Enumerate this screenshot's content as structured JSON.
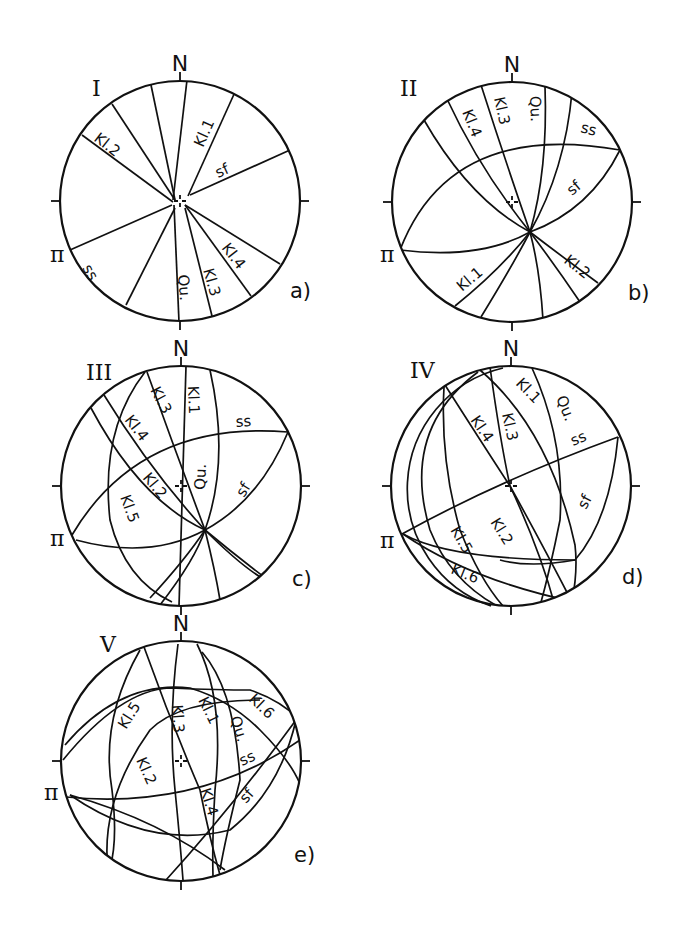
{
  "figure": {
    "background": "#ffffff",
    "ink": "#111111",
    "radius": 120,
    "diagrams": [
      {
        "id": "a",
        "numeral": "I",
        "sublabel": "a)",
        "north": "N",
        "pi": "π",
        "cx": 180,
        "cy": 201,
        "numeral_pos": [
          92,
          96
        ],
        "sublabel_pos": [
          290,
          298
        ],
        "pi_pos": [
          50,
          262
        ],
        "planes": [
          {
            "name": "Kl.1",
            "d": "M 235 92 L 188 196"
          },
          {
            "name": "unlabeled-1",
            "d": "M 187 80 L 173 200"
          },
          {
            "name": "unlabeled-2",
            "d": "M 151 85 L 175 200"
          },
          {
            "name": "unlabeled-3",
            "d": "M 112 104 L 175 200"
          },
          {
            "name": "Kl.2",
            "d": "M 82 135 L 173 202"
          },
          {
            "name": "sf",
            "d": "M 290 150 L 190 195"
          },
          {
            "name": "ss",
            "d": "M 70 250 L 172 205"
          },
          {
            "name": "unlabeled-4",
            "d": "M 126 305 L 175 208"
          },
          {
            "name": "Qu.",
            "d": "M 179 322 L 174 205"
          },
          {
            "name": "Kl.3",
            "d": "M 212 316 L 185 208"
          },
          {
            "name": "Kl.4",
            "d": "M 251 296 L 185 205"
          },
          {
            "name": "unlabeled-5",
            "d": "M 280 264 L 185 205"
          }
        ],
        "labels": [
          {
            "text": "Kl.1",
            "x": 203,
            "y": 148,
            "rot": -66
          },
          {
            "text": "Kl.2",
            "x": 93,
            "y": 140,
            "rot": 38
          },
          {
            "text": "sf",
            "x": 218,
            "y": 178,
            "rot": -24
          },
          {
            "text": "ss",
            "x": 82,
            "y": 268,
            "rot": 60
          },
          {
            "text": "Qu.",
            "x": 178,
            "y": 275,
            "rot": 85
          },
          {
            "text": "Kl.3",
            "x": 203,
            "y": 270,
            "rot": 74
          },
          {
            "text": "Kl.4",
            "x": 221,
            "y": 248,
            "rot": 52
          }
        ]
      },
      {
        "id": "b",
        "numeral": "II",
        "sublabel": "b)",
        "north": "N",
        "pi": "π",
        "cx": 512,
        "cy": 202,
        "numeral_pos": [
          400,
          96
        ],
        "sublabel_pos": [
          628,
          300
        ],
        "pi_pos": [
          380,
          262
        ],
        "planes": [
          {
            "name": "Kl.4",
            "d": "M 447 99 Q 480 170 530 232"
          },
          {
            "name": "Kl.3",
            "d": "M 481 85 Q 505 160 530 232"
          },
          {
            "name": "Qu.",
            "d": "M 545 86 Q 548 170 530 232"
          },
          {
            "name": "unlabeled-1",
            "d": "M 572 92 Q 565 170 530 232"
          },
          {
            "name": "unlabeled-2",
            "d": "M 424 120 Q 470 200 530 232"
          },
          {
            "name": "ss",
            "d": "M 400 250 Q 450 120 620 150"
          },
          {
            "name": "sf",
            "d": "M 620 150 Q 590 210 530 232"
          },
          {
            "name": "pi-girdle",
            "d": "M 400 250 Q 480 260 530 232"
          },
          {
            "name": "Kl.1",
            "d": "M 455 306 Q 500 270 530 232"
          },
          {
            "name": "unlabeled-3",
            "d": "M 481 317 Q 510 270 530 232"
          },
          {
            "name": "unlabeled-4",
            "d": "M 543 320 Q 540 270 530 232"
          },
          {
            "name": "unlabeled-5",
            "d": "M 580 302 Q 555 265 530 232"
          },
          {
            "name": "Kl.2",
            "d": "M 598 283 Q 560 255 530 232"
          }
        ],
        "labels": [
          {
            "text": "Kl.4",
            "x": 462,
            "y": 112,
            "rot": 68
          },
          {
            "text": "Kl.3",
            "x": 494,
            "y": 98,
            "rot": 78
          },
          {
            "text": "Qu.",
            "x": 530,
            "y": 96,
            "rot": 88
          },
          {
            "text": "ss",
            "x": 580,
            "y": 132,
            "rot": 14
          },
          {
            "text": "sf",
            "x": 572,
            "y": 196,
            "rot": -40
          },
          {
            "text": "Kl.1",
            "x": 462,
            "y": 292,
            "rot": -40
          },
          {
            "text": "Kl.2",
            "x": 563,
            "y": 262,
            "rot": 38
          }
        ]
      },
      {
        "id": "c",
        "numeral": "III",
        "sublabel": "c)",
        "north": "N",
        "pi": "π",
        "cx": 181,
        "cy": 486,
        "numeral_pos": [
          86,
          380
        ],
        "sublabel_pos": [
          292,
          586
        ],
        "pi_pos": [
          50,
          546
        ],
        "planes": [
          {
            "name": "Kl.1",
            "d": "M 186 366 L 179 606"
          },
          {
            "name": "Qu.",
            "d": "M 210 370 Q 230 460 205 530 Q 195 560 160 605"
          },
          {
            "name": "Kl.3",
            "d": "M 147 372 Q 175 450 205 530 Q 215 570 220 600"
          },
          {
            "name": "Kl.4",
            "d": "M 104 395 Q 150 470 205 530 Q 240 565 262 578"
          },
          {
            "name": "unlabeled-1",
            "d": "M 91 408 Q 140 500 205 530 Q 235 555 268 580"
          },
          {
            "name": "Kl.5",
            "d": "M 145 372 Q 100 430 110 520 Q 125 580 172 602"
          },
          {
            "name": "Kl.2",
            "d": "M 76 540 Q 150 560 205 530"
          },
          {
            "name": "ss",
            "d": "M 72 535 Q 140 420 288 432"
          },
          {
            "name": "sf",
            "d": "M 288 432 Q 260 500 205 530"
          },
          {
            "name": "unlabeled-2",
            "d": "M 150 598 Q 185 560 205 530"
          }
        ],
        "labels": [
          {
            "text": "Kl.1",
            "x": 188,
            "y": 386,
            "rot": 88
          },
          {
            "text": "Kl.3",
            "x": 150,
            "y": 390,
            "rot": 62
          },
          {
            "text": "Kl.4",
            "x": 124,
            "y": 420,
            "rot": 52
          },
          {
            "text": "ss",
            "x": 236,
            "y": 427,
            "rot": -4
          },
          {
            "text": "Qu.",
            "x": 205,
            "y": 490,
            "rot": -88
          },
          {
            "text": "sf",
            "x": 244,
            "y": 498,
            "rot": -58
          },
          {
            "text": "Kl.2",
            "x": 142,
            "y": 478,
            "rot": 50
          },
          {
            "text": "Kl.5",
            "x": 120,
            "y": 497,
            "rot": 70
          }
        ]
      },
      {
        "id": "d",
        "numeral": "IV",
        "sublabel": "d)",
        "north": "N",
        "pi": "π",
        "cx": 511,
        "cy": 486,
        "numeral_pos": [
          410,
          378
        ],
        "sublabel_pos": [
          622,
          584
        ],
        "pi_pos": [
          380,
          548
        ],
        "planes": [
          {
            "name": "Kl.1",
            "d": "M 480 370 Q 550 430 575 545 Q 578 570 572 602"
          },
          {
            "name": "Qu.",
            "d": "M 532 368 Q 565 440 560 520 Q 550 570 540 606"
          },
          {
            "name": "Kl.3",
            "d": "M 490 367 Q 500 440 510 486"
          },
          {
            "name": "Kl.4",
            "d": "M 445 385 Q 480 440 510 486 Q 540 540 572 602"
          },
          {
            "name": "Kl.2",
            "d": "M 510 486 Q 540 550 555 606"
          },
          {
            "name": "outer-arc",
            "d": "M 478 372 Q 400 430 430 530 Q 450 580 497 606"
          },
          {
            "name": "Kl.5-arc",
            "d": "M 444 387 Q 440 460 460 530 Q 480 580 503 606"
          },
          {
            "name": "ss",
            "d": "M 402 534 Q 500 480 618 437"
          },
          {
            "name": "sf",
            "d": "M 618 437 Q 610 520 575 560 Q 530 568 500 560"
          },
          {
            "name": "Kl.5",
            "d": "M 403 534 Q 450 560 575 560"
          },
          {
            "name": "Kl.6",
            "d": "M 403 534 Q 470 580 575 602"
          }
        ],
        "labels": [
          {
            "text": "Kl.1",
            "x": 515,
            "y": 384,
            "rot": 46
          },
          {
            "text": "Qu.",
            "x": 556,
            "y": 398,
            "rot": 68
          },
          {
            "text": "Kl.3",
            "x": 502,
            "y": 414,
            "rot": 78
          },
          {
            "text": "Kl.4",
            "x": 470,
            "y": 420,
            "rot": 56
          },
          {
            "text": "ss",
            "x": 573,
            "y": 446,
            "rot": -22
          },
          {
            "text": "sf",
            "x": 586,
            "y": 510,
            "rot": -62
          },
          {
            "text": "Kl.2",
            "x": 490,
            "y": 522,
            "rot": 58
          },
          {
            "text": "Kl.5",
            "x": 450,
            "y": 530,
            "rot": 60
          },
          {
            "text": "Kl.6",
            "x": 450,
            "y": 573,
            "rot": 22
          }
        ]
      },
      {
        "id": "e",
        "numeral": "V",
        "sublabel": "e)",
        "north": "N",
        "pi": "π",
        "cx": 181,
        "cy": 761,
        "numeral_pos": [
          100,
          652
        ],
        "sublabel_pos": [
          294,
          862
        ],
        "pi_pos": [
          44,
          800
        ],
        "planes": [
          {
            "name": "Kl.5",
            "d": "M 140 650 Q 100 720 112 790 Q 118 840 110 868"
          },
          {
            "name": "Kl.3",
            "d": "M 178 644 Q 168 720 175 790 Q 180 840 183 880"
          },
          {
            "name": "Kl.1",
            "d": "M 197 644 Q 225 700 215 790 Q 212 840 213 876"
          },
          {
            "name": "Qu.",
            "d": "M 202 652 Q 235 690 240 780 Q 225 840 220 870"
          },
          {
            "name": "Kl.4",
            "d": "M 144 647 Q 170 720 200 790 Q 210 840 220 875"
          },
          {
            "name": "Kl.2",
            "d": "M 65 745 Q 120 680 190 688 Q 230 700 260 730 Q 290 760 300 784"
          },
          {
            "name": "Kl.6",
            "d": "M 63 760 Q 120 690 170 688 Q 220 690 250 690 Q 280 700 300 720"
          },
          {
            "name": "ss",
            "d": "M 66 797 Q 200 810 300 740"
          },
          {
            "name": "sf",
            "d": "M 70 795 Q 150 850 230 830 Q 280 790 296 720"
          },
          {
            "name": "unlabeled-1",
            "d": "M 108 870 Q 100 800 150 730 Q 180 700 260 700"
          },
          {
            "name": "unlabeled-2",
            "d": "M 166 880 Q 230 810 296 720"
          },
          {
            "name": "unlabeled-3",
            "d": "M 70 795 Q 160 820 225 870"
          }
        ],
        "labels": [
          {
            "text": "Kl.5",
            "x": 126,
            "y": 730,
            "rot": -58
          },
          {
            "text": "Kl.3",
            "x": 172,
            "y": 705,
            "rot": 86
          },
          {
            "text": "Kl.1",
            "x": 198,
            "y": 700,
            "rot": 64
          },
          {
            "text": "Qu.",
            "x": 230,
            "y": 718,
            "rot": 72
          },
          {
            "text": "Kl.6",
            "x": 248,
            "y": 700,
            "rot": 44
          },
          {
            "text": "ss",
            "x": 242,
            "y": 766,
            "rot": -24
          },
          {
            "text": "sf",
            "x": 246,
            "y": 804,
            "rot": -48
          },
          {
            "text": "Kl.2",
            "x": 136,
            "y": 760,
            "rot": 66
          },
          {
            "text": "Kl.4",
            "x": 200,
            "y": 790,
            "rot": 72
          }
        ]
      }
    ]
  }
}
